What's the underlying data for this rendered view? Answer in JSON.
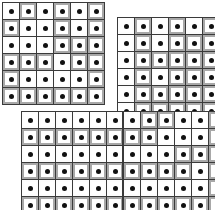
{
  "figure": {
    "title": "",
    "background_color": "#ffffff",
    "line_color": "#3a3a3a",
    "cell_light_color": "#fdfdfd",
    "cell_dark_color": "#a8a8a8",
    "dot_color": "#111111",
    "cell_size_px": 16,
    "dot_size_px": 5
  },
  "chart_data": {
    "type": "heatmap",
    "title": "",
    "xlabel": "",
    "ylabel": "",
    "grid": true,
    "legend": "none",
    "value_map": {
      "0": "light",
      "1": "dark"
    },
    "panels": [
      {
        "name": "top-left-grid",
        "x": 2,
        "y": 2,
        "rows": 6,
        "cols": 6,
        "cells": [
          [
            0,
            1,
            0,
            1,
            0,
            1
          ],
          [
            1,
            0,
            0,
            1,
            0,
            1
          ],
          [
            0,
            0,
            0,
            1,
            1,
            1
          ],
          [
            1,
            1,
            1,
            0,
            1,
            1
          ],
          [
            1,
            0,
            0,
            0,
            0,
            1
          ],
          [
            1,
            1,
            1,
            1,
            1,
            1
          ]
        ]
      },
      {
        "name": "top-right-grid",
        "x": 117,
        "y": 17,
        "rows": 6,
        "cols": 6,
        "cells": [
          [
            0,
            1,
            0,
            1,
            0,
            1
          ],
          [
            0,
            1,
            0,
            1,
            1,
            1
          ],
          [
            0,
            1,
            1,
            1,
            1,
            1
          ],
          [
            0,
            1,
            0,
            1,
            1,
            1
          ],
          [
            0,
            1,
            1,
            1,
            1,
            1
          ],
          [
            0,
            1,
            1,
            1,
            1,
            1
          ]
        ]
      },
      {
        "name": "bottom-wide-grid",
        "x": 21,
        "y": 111,
        "rows": 6,
        "cols": 12,
        "divider_after_col": 6,
        "cells": [
          [
            0,
            0,
            0,
            0,
            0,
            0,
            0,
            1,
            1,
            0,
            0,
            1
          ],
          [
            1,
            1,
            1,
            1,
            1,
            1,
            1,
            1,
            0,
            0,
            0,
            1
          ],
          [
            0,
            0,
            0,
            0,
            0,
            0,
            0,
            0,
            0,
            1,
            1,
            1
          ],
          [
            1,
            1,
            1,
            1,
            1,
            1,
            1,
            1,
            1,
            1,
            0,
            1
          ],
          [
            0,
            0,
            0,
            0,
            0,
            0,
            0,
            0,
            0,
            0,
            0,
            1
          ],
          [
            1,
            1,
            1,
            1,
            1,
            1,
            1,
            1,
            1,
            1,
            1,
            1
          ]
        ]
      }
    ]
  }
}
